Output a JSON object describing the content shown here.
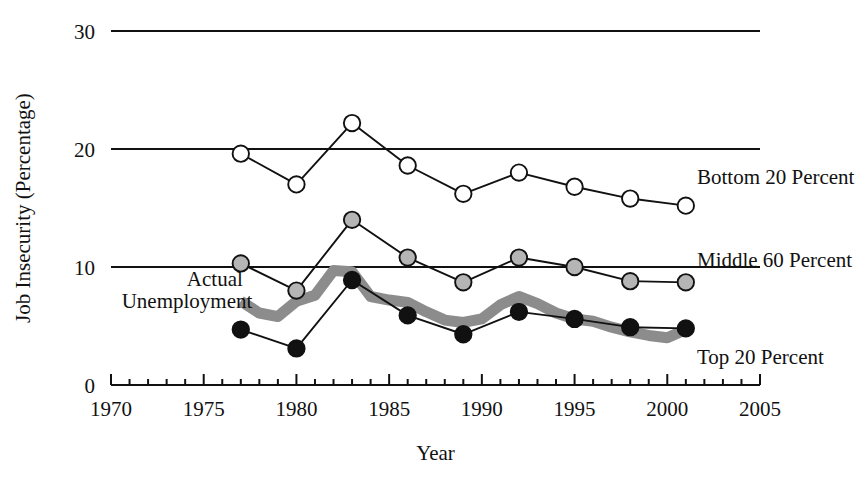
{
  "figure": {
    "faint_top_title": "",
    "background_color": "#ffffff",
    "ink_color": "#111111"
  },
  "chart_data": {
    "type": "line",
    "title": "",
    "xlabel": "Year",
    "ylabel": "Job Insecurity (Percentage)",
    "xlim": [
      1970,
      2005
    ],
    "ylim": [
      0,
      30
    ],
    "xticks": [
      1970,
      1975,
      1980,
      1985,
      1990,
      1995,
      2000,
      2005
    ],
    "xtick_labels": [
      "1970",
      "1975",
      "1980",
      "1985",
      "1990",
      "1995",
      "2000",
      "2005"
    ],
    "xminor_step": 1,
    "yticks": [
      0,
      10,
      20,
      30
    ],
    "ytick_labels": [
      "0",
      "10",
      "20",
      "30"
    ],
    "grid": "horizontal gridlines at 10, 20, 30",
    "legend_position": "inline-right",
    "x": [
      1977,
      1980,
      1983,
      1986,
      1989,
      1992,
      1995,
      1998,
      2001
    ],
    "series": [
      {
        "name": "Bottom 20 Percent",
        "label": "Bottom 20 Percent",
        "marker": "open-circle",
        "marker_fill": "#ffffff",
        "marker_stroke": "#111111",
        "line_color": "#111111",
        "values": [
          19.6,
          17.0,
          22.2,
          18.6,
          16.2,
          18.0,
          16.8,
          15.8,
          15.2
        ],
        "label_x": 2001.6,
        "label_y": 17.6
      },
      {
        "name": "Middle 60 Percent",
        "label": "Middle 60 Percent",
        "marker": "gray-circle",
        "marker_fill": "#b5b5b5",
        "marker_stroke": "#111111",
        "line_color": "#111111",
        "values": [
          10.3,
          8.0,
          14.0,
          10.8,
          8.7,
          10.8,
          10.0,
          8.8,
          8.7
        ],
        "label_x": 2001.6,
        "label_y": 10.6
      },
      {
        "name": "Top 20 Percent",
        "label": "Top 20 Percent",
        "marker": "filled-circle",
        "marker_fill": "#111111",
        "marker_stroke": "#111111",
        "line_color": "#111111",
        "values": [
          4.7,
          3.1,
          8.9,
          5.9,
          4.3,
          6.2,
          5.6,
          4.9,
          4.8
        ],
        "label_x": 2001.6,
        "label_y": 2.4
      }
    ],
    "band_series": {
      "name": "Actual Unemployment",
      "label_line1": "Actual",
      "label_line2": "Unemployment",
      "color": "#8c8c8c",
      "stroke_width_px": 11,
      "label1_x": 1975.6,
      "label1_y": 9.0,
      "label2_x": 1974.1,
      "label2_y": 7.1,
      "x": [
        1977,
        1978,
        1979,
        1980,
        1981,
        1982,
        1983,
        1984,
        1985,
        1986,
        1987,
        1988,
        1989,
        1990,
        1991,
        1992,
        1993,
        1994,
        1995,
        1996,
        1997,
        1998,
        1999,
        2000,
        2001
      ],
      "values": [
        7.1,
        6.1,
        5.8,
        7.1,
        7.6,
        9.7,
        9.6,
        7.5,
        7.2,
        7.0,
        6.2,
        5.5,
        5.3,
        5.6,
        6.8,
        7.5,
        6.9,
        6.1,
        5.6,
        5.4,
        4.9,
        4.5,
        4.2,
        4.0,
        4.7
      ]
    }
  }
}
